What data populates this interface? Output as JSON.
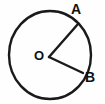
{
  "figure": {
    "kind": "circle-with-central-angle",
    "background_color": "#fefefe",
    "stroke_color": "#1a1a1a",
    "label_color": "#111111",
    "circle": {
      "center_x": 50,
      "center_y": 55,
      "radius_x": 41,
      "radius_y": 44,
      "stroke_width": 2.4
    },
    "vertex": {
      "name": "O",
      "x": 49,
      "y": 57
    },
    "radii": [
      {
        "name": "radius-OA",
        "from_x": 49,
        "from_y": 57,
        "to_x": 78,
        "to_y": 24,
        "stroke_width": 2.4
      },
      {
        "name": "radius-OB",
        "from_x": 49,
        "from_y": 57,
        "to_x": 83,
        "to_y": 73,
        "stroke_width": 2.4
      }
    ],
    "labels": {
      "center": "O",
      "point_a": "A",
      "point_b": "B"
    }
  }
}
